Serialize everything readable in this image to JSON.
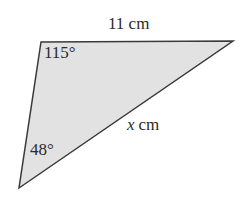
{
  "figure": {
    "type": "triangle-diagram",
    "background_color": "#ffffff",
    "fill_color": "#e2e2e2",
    "stroke_color": "#3a3a3a",
    "stroke_width": 1.5,
    "text_color": "#2b2b2b",
    "vertices": {
      "top_left": {
        "x": 41,
        "y": 42
      },
      "top_right": {
        "x": 233,
        "y": 41
      },
      "bottom_left": {
        "x": 19,
        "y": 188
      }
    },
    "labels": {
      "side_top": {
        "text": "11 cm",
        "value": "11",
        "unit": "cm",
        "name": "top-side-length"
      },
      "side_hypotenuse": {
        "text": "x cm",
        "value": "x",
        "unit": "cm",
        "name": "unknown-side-length"
      },
      "angle_top_left": {
        "text": "115°",
        "value": "115",
        "unit": "°",
        "name": "angle-at-top-left-vertex"
      },
      "angle_bottom_left": {
        "text": "48°",
        "value": "48",
        "unit": "°",
        "name": "angle-at-bottom-left-vertex"
      }
    }
  },
  "chart_data": {
    "type": "diagram",
    "title": "",
    "shape": "triangle",
    "sides": [
      {
        "label": "11 cm",
        "known": true,
        "value": 11,
        "unit": "cm",
        "position": "top"
      },
      {
        "label": "x cm",
        "known": false,
        "value": null,
        "unit": "cm",
        "position": "hypotenuse"
      }
    ],
    "angles": [
      {
        "label": "115°",
        "value": 115,
        "unit": "degrees",
        "vertex": "top-left"
      },
      {
        "label": "48°",
        "value": 48,
        "unit": "degrees",
        "vertex": "bottom-left"
      }
    ]
  }
}
